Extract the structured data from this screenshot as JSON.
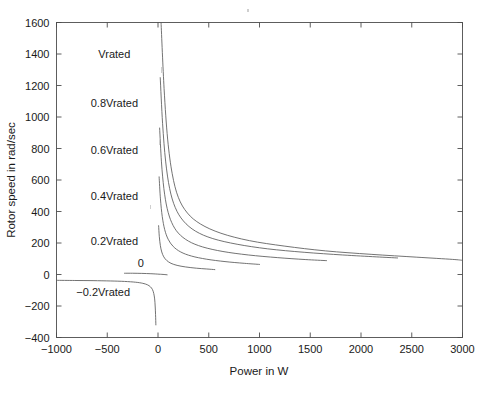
{
  "chart_data": {
    "type": "line",
    "title": "",
    "xlabel": "Power in W",
    "ylabel": "Rotor speed in rad/sec",
    "xlim": [
      -1000,
      3000
    ],
    "ylim": [
      -400,
      1600
    ],
    "xticks": [
      -1000,
      -500,
      0,
      500,
      1000,
      1500,
      2000,
      2500,
      3000
    ],
    "yticks": [
      -400,
      -200,
      0,
      200,
      400,
      600,
      800,
      1000,
      1200,
      1400,
      1600
    ],
    "xtick_labels": [
      "-1000",
      "-500",
      "0",
      "500",
      "1000",
      "1500",
      "2000",
      "2500",
      "3000"
    ],
    "ytick_labels": [
      "-400",
      "-200",
      "0",
      "200",
      "400",
      "600",
      "800",
      "1000",
      "1200",
      "1400",
      "1600"
    ],
    "grid": false,
    "legend": "inline-annotations",
    "line_color": "#5a5a5a",
    "axis_color": "#4d4d4d",
    "annotations": [
      {
        "text": "Vrated",
        "x": -430,
        "y": 1400
      },
      {
        "text": "0.8Vrated",
        "x": -430,
        "y": 1090
      },
      {
        "text": "0.6Vrated",
        "x": -430,
        "y": 790
      },
      {
        "text": "0.4Vrated",
        "x": -430,
        "y": 500
      },
      {
        "text": "0.2Vrated",
        "x": -430,
        "y": 215
      },
      {
        "text": "0",
        "x": -170,
        "y": 75
      },
      {
        "text": "-0.2Vrated",
        "x": -540,
        "y": -110
      }
    ],
    "series": [
      {
        "name": "Vrated",
        "points": [
          [
            30,
            1600
          ],
          [
            60,
            1180
          ],
          [
            95,
            860
          ],
          [
            140,
            640
          ],
          [
            200,
            490
          ],
          [
            290,
            390
          ],
          [
            420,
            320
          ],
          [
            620,
            262
          ],
          [
            900,
            215
          ],
          [
            1250,
            180
          ],
          [
            1650,
            150
          ],
          [
            2100,
            128
          ],
          [
            2550,
            110
          ],
          [
            2900,
            96
          ],
          [
            3000,
            90
          ]
        ]
      },
      {
        "name": "0.8Vrated",
        "points": [
          [
            22,
            1250
          ],
          [
            45,
            960
          ],
          [
            75,
            720
          ],
          [
            115,
            545
          ],
          [
            170,
            425
          ],
          [
            250,
            340
          ],
          [
            370,
            275
          ],
          [
            540,
            228
          ],
          [
            780,
            192
          ],
          [
            1080,
            163
          ],
          [
            1440,
            141
          ],
          [
            1820,
            124
          ],
          [
            2150,
            112
          ],
          [
            2360,
            105
          ]
        ]
      },
      {
        "name": "0.6Vrated",
        "points": [
          [
            16,
            930
          ],
          [
            34,
            715
          ],
          [
            58,
            545
          ],
          [
            90,
            420
          ],
          [
            135,
            330
          ],
          [
            200,
            263
          ],
          [
            300,
            212
          ],
          [
            440,
            175
          ],
          [
            640,
            146
          ],
          [
            890,
            124
          ],
          [
            1180,
            107
          ],
          [
            1450,
            95
          ],
          [
            1660,
            88
          ]
        ]
      },
      {
        "name": "0.4Vrated",
        "points": [
          [
            11,
            620
          ],
          [
            24,
            480
          ],
          [
            42,
            368
          ],
          [
            66,
            285
          ],
          [
            100,
            224
          ],
          [
            150,
            178
          ],
          [
            224,
            143
          ],
          [
            330,
            117
          ],
          [
            480,
            97
          ],
          [
            660,
            82
          ],
          [
            850,
            71
          ],
          [
            1000,
            64
          ]
        ]
      },
      {
        "name": "0.2Vrated",
        "points": [
          [
            6,
            310
          ],
          [
            13,
            240
          ],
          [
            23,
            185
          ],
          [
            37,
            143
          ],
          [
            57,
            112
          ],
          [
            86,
            89
          ],
          [
            128,
            71
          ],
          [
            188,
            58
          ],
          [
            272,
            48
          ],
          [
            378,
            40
          ],
          [
            480,
            35
          ],
          [
            560,
            31
          ]
        ]
      },
      {
        "name": "0",
        "points": [
          [
            -330,
            8
          ],
          [
            -250,
            8
          ],
          [
            -160,
            7
          ],
          [
            -70,
            5
          ],
          [
            10,
            2
          ],
          [
            60,
            0
          ],
          [
            90,
            -2
          ]
        ]
      },
      {
        "name": "-0.2Vrated",
        "points": [
          [
            -1000,
            -37
          ],
          [
            -820,
            -38
          ],
          [
            -640,
            -39
          ],
          [
            -470,
            -41
          ],
          [
            -330,
            -44
          ],
          [
            -220,
            -49
          ],
          [
            -150,
            -56
          ],
          [
            -105,
            -65
          ],
          [
            -75,
            -78
          ],
          [
            -55,
            -95
          ],
          [
            -42,
            -120
          ],
          [
            -33,
            -155
          ],
          [
            -28,
            -200
          ],
          [
            -24,
            -255
          ],
          [
            -21,
            -320
          ]
        ]
      }
    ]
  },
  "caption": {
    "text": ""
  }
}
